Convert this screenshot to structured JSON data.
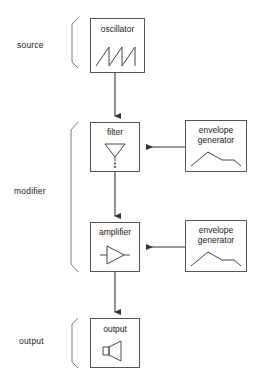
{
  "diagram": {
    "stroke_color": "#555555",
    "text_color": "#1a1a1a",
    "background": "#ffffff",
    "groups": [
      {
        "id": "source",
        "label": "source"
      },
      {
        "id": "modifier",
        "label": "modifier"
      },
      {
        "id": "output",
        "label": "output"
      }
    ],
    "nodes": [
      {
        "id": "oscillator",
        "label": "oscillator",
        "icon": "sawtooth-wave-icon"
      },
      {
        "id": "filter",
        "label": "filter",
        "icon": "funnel-icon"
      },
      {
        "id": "amplifier",
        "label": "amplifier",
        "icon": "amplifier-triangle-icon"
      },
      {
        "id": "output",
        "label": "output",
        "icon": "speaker-icon"
      },
      {
        "id": "envelope_generator_1",
        "label_line1": "envelope",
        "label_line2": "generator",
        "icon": "envelope-curve-icon"
      },
      {
        "id": "envelope_generator_2",
        "label_line1": "envelope",
        "label_line2": "generator",
        "icon": "envelope-curve-icon"
      }
    ],
    "connections": [
      {
        "from": "oscillator",
        "to": "filter",
        "direction": "down",
        "arrow": "arrowhead-down-icon"
      },
      {
        "from": "filter",
        "to": "amplifier",
        "direction": "down",
        "arrow": "arrowhead-down-icon"
      },
      {
        "from": "amplifier",
        "to": "output",
        "direction": "down",
        "arrow": "arrowhead-down-icon"
      },
      {
        "from": "envelope_generator_1",
        "to": "filter",
        "direction": "left",
        "arrow": "arrowhead-left-icon"
      },
      {
        "from": "envelope_generator_2",
        "to": "amplifier",
        "direction": "left",
        "arrow": "arrowhead-left-icon"
      }
    ]
  }
}
